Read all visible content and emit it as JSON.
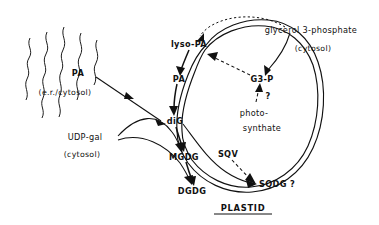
{
  "figure": {
    "title": "PLASTID",
    "compartment_label": "PLASTID"
  },
  "labels": {
    "er_pa": "PA",
    "er_compartment": "(e.r./cytosol)",
    "udp_gal": "UDP-gal",
    "udp_gal_compartment": "(cytosol)",
    "lyso_pa": "lyso-PA",
    "plastid_pa": "PA",
    "dig": "diG",
    "mgdg": "MGDG",
    "dgdg": "DGDG",
    "sqdg": "SQDG ?",
    "sqv": "SQV",
    "g3p": "G3-P",
    "question_mark": "?",
    "photosynthate_line1": "photo-",
    "photosynthate_line2": "synthate",
    "glycerol3p": "glycerol 3-phosphate",
    "glycerol3p_compartment": "(cytosol)",
    "plastid": "PLASTID"
  },
  "colors": {
    "ink": "#111111",
    "background": "#ffffff"
  },
  "diagram_data": {
    "type": "pathway-diagram",
    "compartments": [
      {
        "name": "e.r./cytosol",
        "label": "(e.r./cytosol)",
        "rendering": "wavy-lines"
      },
      {
        "name": "cytosol",
        "label": "(cytosol)"
      },
      {
        "name": "plastid",
        "label": "PLASTID",
        "rendering": "double-membrane-envelope"
      }
    ],
    "metabolites": [
      {
        "id": "er_pa",
        "label": "PA",
        "compartment": "e.r./cytosol"
      },
      {
        "id": "udp_gal",
        "label": "UDP-gal",
        "compartment": "cytosol"
      },
      {
        "id": "glycerol3p",
        "label": "glycerol 3-phosphate",
        "compartment": "cytosol"
      },
      {
        "id": "lyso_pa",
        "label": "lyso-PA",
        "compartment": "plastid-envelope"
      },
      {
        "id": "plastid_pa",
        "label": "PA",
        "compartment": "plastid-envelope"
      },
      {
        "id": "dig",
        "label": "diG",
        "compartment": "plastid-envelope"
      },
      {
        "id": "mgdg",
        "label": "MGDG",
        "compartment": "plastid-envelope"
      },
      {
        "id": "dgdg",
        "label": "DGDG",
        "compartment": "plastid-envelope"
      },
      {
        "id": "sqdg",
        "label": "SQDG ?",
        "compartment": "plastid-envelope"
      },
      {
        "id": "g3p",
        "label": "G3-P",
        "compartment": "plastid"
      },
      {
        "id": "sqv",
        "label": "SQV",
        "compartment": "plastid"
      },
      {
        "id": "photosynthate",
        "label": "photo-synthate",
        "compartment": "plastid"
      }
    ],
    "reactions": [
      {
        "from": "er_pa",
        "to": "dig",
        "style": "solid"
      },
      {
        "from": "glycerol3p",
        "to": "lyso_pa",
        "style": "dotted"
      },
      {
        "from": "glycerol3p",
        "to": "g3p",
        "style": "solid"
      },
      {
        "from": "g3p",
        "to": "lyso_pa",
        "style": "dashed"
      },
      {
        "from": "photosynthate",
        "to": "g3p",
        "style": "dashed",
        "annotation": "?"
      },
      {
        "from": "lyso_pa",
        "to": "plastid_pa",
        "style": "solid"
      },
      {
        "from": "plastid_pa",
        "to": "dig",
        "style": "solid"
      },
      {
        "from": "udp_gal",
        "to": "mgdg",
        "style": "solid"
      },
      {
        "from": "udp_gal",
        "to": "dgdg",
        "style": "solid"
      },
      {
        "from": "dig",
        "to": "mgdg",
        "style": "solid"
      },
      {
        "from": "mgdg",
        "to": "dgdg",
        "style": "solid"
      },
      {
        "from": "dig",
        "to": "sqdg",
        "style": "solid"
      },
      {
        "from": "sqv",
        "to": "sqdg",
        "style": "dashed"
      }
    ]
  }
}
